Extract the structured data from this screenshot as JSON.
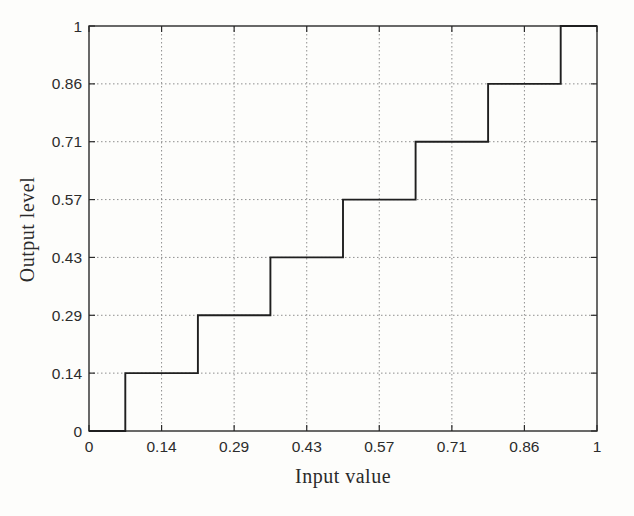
{
  "figure": {
    "background_color": "#fdfdfb",
    "axis_color": "#2a2a2a",
    "grid_color": "#8f8f8f",
    "line_color": "#1f1f1f",
    "text_color": "#2c2c2c"
  },
  "chart_data": {
    "type": "line",
    "subtype": "staircase-step",
    "title": "",
    "xlabel": "Input value",
    "ylabel": "Output level",
    "xlim": [
      0,
      1
    ],
    "ylim": [
      0,
      1
    ],
    "grid": "on",
    "grid_style": "dotted",
    "legend": "none",
    "x_tick_values": [
      0,
      0.1429,
      0.2857,
      0.4286,
      0.5714,
      0.7143,
      0.8571,
      1
    ],
    "x_tick_labels": [
      "0",
      "0.14",
      "0.29",
      "0.43",
      "0.57",
      "0.71",
      "0.86",
      "1"
    ],
    "y_tick_values": [
      0,
      0.1429,
      0.2857,
      0.4286,
      0.5714,
      0.7143,
      0.8571,
      1
    ],
    "y_tick_labels": [
      "0",
      "0.14",
      "0.29",
      "0.43",
      "0.57",
      "0.71",
      "0.86",
      "1"
    ],
    "series": [
      {
        "name": "quantizer-staircase",
        "step_thresholds_x": [
          0.0714,
          0.2143,
          0.3571,
          0.5,
          0.6429,
          0.7857,
          0.9286
        ],
        "output_levels_y": [
          0,
          0.1429,
          0.2857,
          0.4286,
          0.5714,
          0.7143,
          0.8571,
          1
        ],
        "points": [
          [
            0,
            0
          ],
          [
            0.0714,
            0
          ],
          [
            0.0714,
            0.1429
          ],
          [
            0.2143,
            0.1429
          ],
          [
            0.2143,
            0.2857
          ],
          [
            0.3571,
            0.2857
          ],
          [
            0.3571,
            0.4286
          ],
          [
            0.5,
            0.4286
          ],
          [
            0.5,
            0.5714
          ],
          [
            0.6429,
            0.5714
          ],
          [
            0.6429,
            0.7143
          ],
          [
            0.7857,
            0.7143
          ],
          [
            0.7857,
            0.8571
          ],
          [
            0.9286,
            0.8571
          ],
          [
            0.9286,
            1
          ],
          [
            1,
            1
          ]
        ]
      }
    ]
  }
}
